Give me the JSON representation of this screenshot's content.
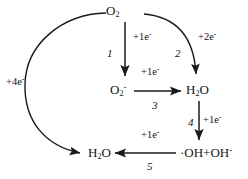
{
  "diagram": {
    "type": "cycle-flow-diagram",
    "stroke_color": "#1a1a1a",
    "background_color": "#ffffff",
    "nodes": [
      {
        "id": "o2",
        "label_html": "O<sub>2</sub>",
        "text": "O2"
      },
      {
        "id": "superoxide",
        "label_html": "O<sub>2</sub><sup>-</sup>",
        "text": "O2-"
      },
      {
        "id": "h2o2",
        "label_html": "H<sub>2</sub>O",
        "text": "H2O"
      },
      {
        "id": "hydroxyl",
        "label_html": "&#183;OH+OH<sup>-</sup>",
        "text": "OH+OH-"
      },
      {
        "id": "water",
        "label_html": "H<sub>2</sub>O",
        "text": "H2O"
      }
    ],
    "electron_tags": {
      "e1": "+1e<sup>-</sup>",
      "e2": "+2e<sup>-</sup>",
      "e3": "+1e<sup>-</sup>",
      "e4": "+1e<sup>-</sup>",
      "e5": "+1e<sup>-</sup>",
      "e_outer": "+4e<sup>-</sup>"
    },
    "steps": {
      "s1": "1",
      "s2": "2",
      "s3": "3",
      "s4": "4",
      "s5": "5"
    }
  }
}
